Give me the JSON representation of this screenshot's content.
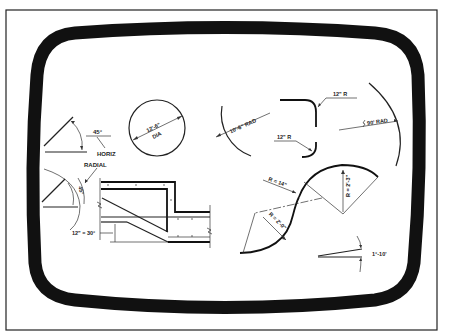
{
  "figure": {
    "type": "drafting-dimensioning-examples-on-crt-screen",
    "colors": {
      "background": "#ffffff",
      "ink": "#111111",
      "frame": "#111111"
    }
  },
  "examples": {
    "angle_horizontal": {
      "angle_label": "45°",
      "reference_label": "HORIZ"
    },
    "circle_diameter": {
      "dimension": "12'-6\"",
      "suffix": "DIA"
    },
    "arc_radius": {
      "dimension": "10'-6\" RAD"
    },
    "fillet_top": {
      "dimension": "12\" R"
    },
    "fillet_bottom": {
      "dimension": "12\" R"
    },
    "long_radius": {
      "dimension": "90' RAD"
    },
    "angle_radial": {
      "angle_label": "45°",
      "reference_label": "RADIAL"
    },
    "slope_section": {
      "dimension": "12\" = 30°"
    },
    "reverse_curve": {
      "radius_a": "R = 14\"",
      "radius_b": "R = 2'-3\"",
      "radius_c": "R = 2'-0\""
    },
    "small_angle": {
      "angle_label": "1°-10'"
    }
  }
}
